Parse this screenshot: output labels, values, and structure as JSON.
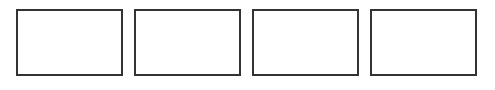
{
  "canvas": {
    "width": 495,
    "height": 90,
    "background": "#ffffff"
  },
  "panels": [
    {
      "id": "panel-1",
      "left": 16,
      "label": ""
    },
    {
      "id": "panel-2",
      "left": 134,
      "label": ""
    },
    {
      "id": "panel-3",
      "left": 252,
      "label": ""
    },
    {
      "id": "panel-4",
      "left": 370,
      "label": ""
    }
  ],
  "style": {
    "border_color": "#333333",
    "border_width_px": 2
  }
}
